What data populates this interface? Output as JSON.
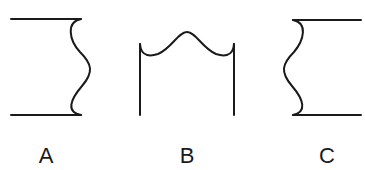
{
  "figures": [
    {
      "id": "A",
      "label": "A",
      "description": "Two horizontal lines joined on the right by a wavy edge bulging outward"
    },
    {
      "id": "B",
      "label": "B",
      "description": "Two vertical lines joined at the top by a wavy edge bulging upward"
    },
    {
      "id": "C",
      "label": "C",
      "description": "Two horizontal lines joined on the left by a wavy edge bulging outward"
    }
  ],
  "colors": {
    "stroke": "#1a1a1a",
    "background": "#ffffff"
  }
}
